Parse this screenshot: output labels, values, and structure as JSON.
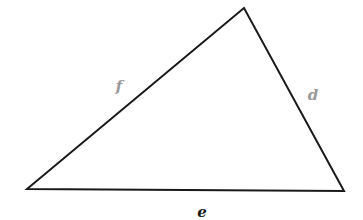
{
  "diagram": {
    "type": "triangle",
    "background": "#ffffff",
    "stroke_color": "#1a1a1a",
    "vertices": {
      "left": [
        27,
        189
      ],
      "top": [
        244,
        8
      ],
      "right": [
        344,
        191
      ]
    },
    "sides": [
      {
        "name": "f",
        "label": "f",
        "from": "left",
        "to": "top",
        "color": "#9a9a9a",
        "label_pos": [
          119,
          91
        ]
      },
      {
        "name": "d",
        "label": "d",
        "from": "top",
        "to": "right",
        "color": "#9a9a9a",
        "label_pos": [
          313,
          100
        ]
      },
      {
        "name": "e",
        "label": "e",
        "from": "left",
        "to": "right",
        "color": "#1a1a1a",
        "label_pos": [
          202,
          217
        ]
      }
    ]
  }
}
